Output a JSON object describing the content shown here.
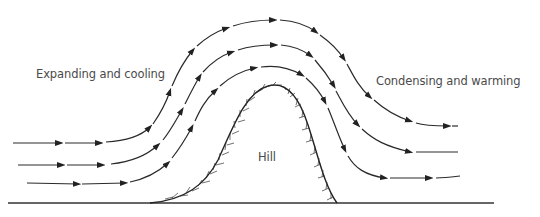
{
  "diagram": {
    "labels": {
      "left": "Expanding and cooling",
      "right": "Condensing and warming",
      "hill": "Hill"
    },
    "streamlines": [
      {
        "name": "outer",
        "direction": "left-to-right"
      },
      {
        "name": "middle",
        "direction": "left-to-right"
      },
      {
        "name": "inner",
        "direction": "left-to-right"
      }
    ],
    "colors": {
      "line": "#2a2a2a",
      "text": "#4a4a4a",
      "background": "#ffffff"
    }
  }
}
